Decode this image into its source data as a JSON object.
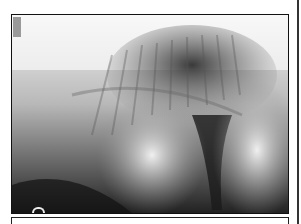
{
  "figure": {
    "type": "radiograph",
    "corner_label": "",
    "marker_label": "D"
  },
  "colors": {
    "frame_border": "#111111",
    "background": "#ffffff"
  }
}
